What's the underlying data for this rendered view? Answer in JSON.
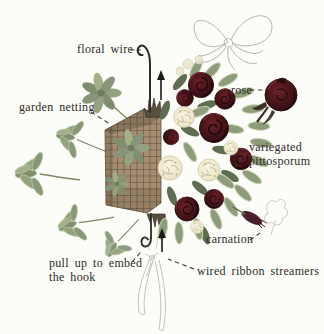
{
  "labels": {
    "floral_wire": "floral wire",
    "garden_netting": "garden netting",
    "rose": "rose",
    "variegated_pittosporum": "variegated pittosporum",
    "carnation": "carnation",
    "pull_up_hook": "pull up to embed the hook",
    "wired_ribbon_streamers": "wired ribbon streamers"
  },
  "illustration_parts": [
    "floral-wire-hook",
    "hanging-wire",
    "pull-up-arrow-top",
    "pull-up-arrow-bottom",
    "garden-netting-foam-basket",
    "flower-bouquet",
    "rose-bud-detail",
    "carnation-bud-detail",
    "ribbon-bow-sketch",
    "ribbon-streamers",
    "leaf-sprigs"
  ],
  "colors": {
    "background": "#fcfcf9",
    "text": "#2d2b27",
    "connector": "#454035",
    "rose_dark": "#3f1317",
    "carnation_cream": "#efe9d0",
    "foliage_green": "#8a9a78",
    "foam_tan": "#a28a6c",
    "netting_dark": "#3f3428",
    "sketch_gray": "#bfbdb6"
  }
}
